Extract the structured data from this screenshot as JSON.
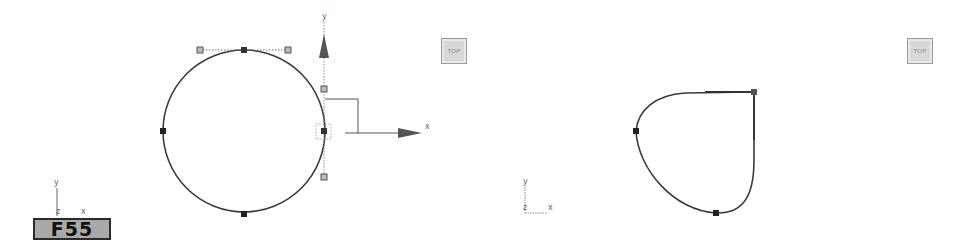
{
  "figure_label": "F55",
  "viewports": [
    {
      "id": "left",
      "viewcube_label": "TOP",
      "gizmo": {
        "x_axis_label": "x",
        "y_axis_label": "y"
      },
      "tripod": {
        "y_label": "y",
        "z_label": "z",
        "x_label": "x"
      },
      "shape": "circle",
      "vertex_count": 4
    },
    {
      "id": "right",
      "viewcube_label": "TOP",
      "tripod": {
        "y_label": "y",
        "z_label": "z",
        "x_label": "x"
      },
      "shape": "teardrop",
      "vertex_count": 3
    }
  ]
}
